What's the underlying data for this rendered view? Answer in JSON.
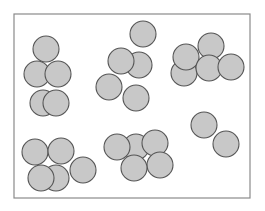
{
  "diagram": {
    "frame": {
      "x": 14,
      "y": 14,
      "width": 236,
      "height": 184,
      "stroke": "#8a8a8a",
      "stroke_width": 1.2
    },
    "circle_style": {
      "fill": "#c8c8c8",
      "stroke": "#555555",
      "stroke_width": 1.1,
      "radius": 13
    },
    "clusters": [
      {
        "name": "cluster-top-left",
        "count": 5,
        "circles": [
          {
            "cx": 46,
            "cy": 49
          },
          {
            "cx": 37,
            "cy": 74
          },
          {
            "cx": 58,
            "cy": 74
          },
          {
            "cx": 43,
            "cy": 103
          },
          {
            "cx": 56,
            "cy": 103
          }
        ]
      },
      {
        "name": "cluster-top-center",
        "count": 5,
        "circles": [
          {
            "cx": 143,
            "cy": 34
          },
          {
            "cx": 139,
            "cy": 65
          },
          {
            "cx": 121,
            "cy": 61
          },
          {
            "cx": 109,
            "cy": 87
          },
          {
            "cx": 136,
            "cy": 98
          }
        ]
      },
      {
        "name": "cluster-top-right",
        "count": 5,
        "circles": [
          {
            "cx": 184,
            "cy": 73
          },
          {
            "cx": 186,
            "cy": 57
          },
          {
            "cx": 211,
            "cy": 46
          },
          {
            "cx": 209,
            "cy": 68
          },
          {
            "cx": 231,
            "cy": 67
          }
        ]
      },
      {
        "name": "cluster-bottom-left",
        "count": 5,
        "circles": [
          {
            "cx": 35,
            "cy": 152
          },
          {
            "cx": 61,
            "cy": 151
          },
          {
            "cx": 56,
            "cy": 178
          },
          {
            "cx": 41,
            "cy": 178
          },
          {
            "cx": 83,
            "cy": 170
          }
        ]
      },
      {
        "name": "cluster-bottom-center",
        "count": 5,
        "circles": [
          {
            "cx": 136,
            "cy": 147
          },
          {
            "cx": 117,
            "cy": 147
          },
          {
            "cx": 155,
            "cy": 143
          },
          {
            "cx": 160,
            "cy": 165
          },
          {
            "cx": 134,
            "cy": 168
          }
        ]
      },
      {
        "name": "cluster-bottom-right",
        "count": 2,
        "circles": [
          {
            "cx": 204,
            "cy": 125
          },
          {
            "cx": 226,
            "cy": 144
          }
        ]
      }
    ]
  }
}
